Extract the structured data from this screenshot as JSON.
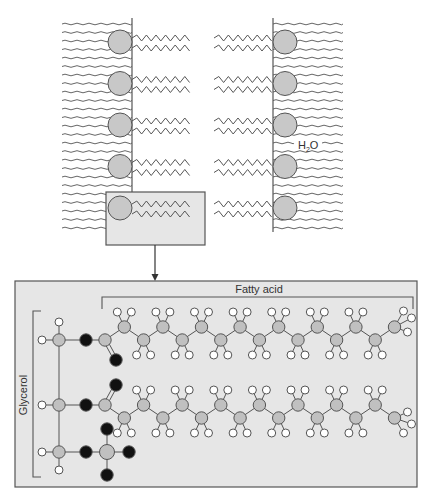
{
  "labels": {
    "water": "H",
    "water_sub": "2",
    "water_tail": "O",
    "fatty_acid": "Fatty acid",
    "glycerol": "Glycerol"
  },
  "colors": {
    "head_group": "#c8c8c8",
    "carbon": "#c0c0c0",
    "oxygen": "#111111",
    "hydrogen": "#ffffff",
    "box_fill": "#e6e6e6",
    "stroke": "#555555"
  },
  "membrane": {
    "lipids_per_leaflet": 5,
    "water_lines_per_side": 25
  },
  "molecule": {
    "glycerol_carbons": 3,
    "fatty_acid_chains": 2,
    "carbons_per_chain": 16,
    "phosphate_group": true
  }
}
